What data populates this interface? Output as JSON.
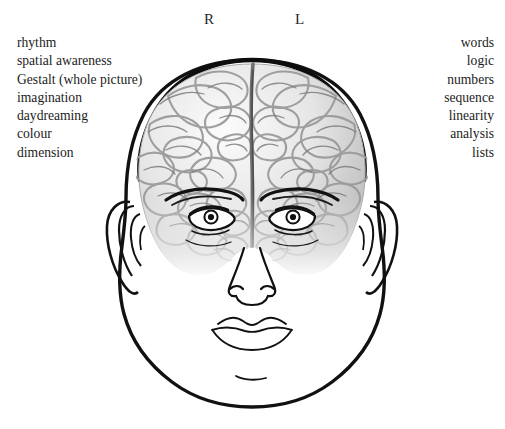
{
  "hemispheres": {
    "right_label": "R",
    "left_label": "L"
  },
  "right_brain_functions": [
    "rhythm",
    "spatial awareness",
    "Gestalt (whole picture)",
    "imagination",
    "daydreaming",
    "colour",
    "dimension"
  ],
  "left_brain_functions": [
    "words",
    "logic",
    "numbers",
    "sequence",
    "linearity",
    "analysis",
    "lists"
  ],
  "figure": {
    "name": "head-with-brain-illustration",
    "colors": {
      "outline": "#111111",
      "brain_light": "#f2f2f2",
      "brain_mid": "#cfcfcf",
      "brain_dark": "#8a8a8a",
      "background": "#ffffff"
    }
  }
}
